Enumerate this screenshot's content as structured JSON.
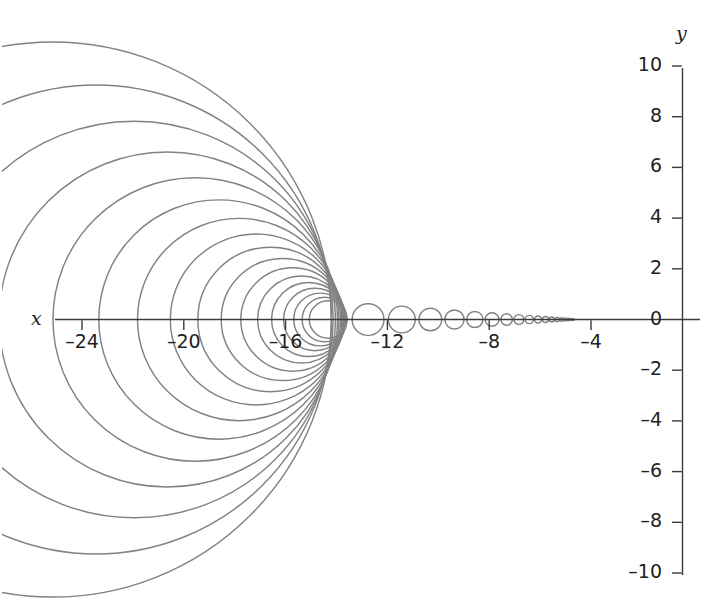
{
  "chart_data": {
    "type": "line",
    "title": "",
    "subtitle": "",
    "xlabel": "x",
    "ylabel": "y",
    "xlim": [
      -25.8,
      -3.0
    ],
    "ylim": [
      -10,
      10
    ],
    "grid": false,
    "legend": null,
    "annotations": [],
    "xticks": [
      -24,
      -20,
      -16,
      -12,
      -8,
      -4
    ],
    "xtick_labels": [
      "–24",
      "–20",
      "–16",
      "–12",
      "–8",
      "–4"
    ],
    "yticks": [
      10,
      8,
      6,
      4,
      2,
      0,
      -2,
      -4,
      -6,
      -8,
      -10
    ],
    "ytick_labels": [
      "10",
      "8",
      "6",
      "4",
      "2",
      "0",
      "–2",
      "–4",
      "–6",
      "–8",
      "–10"
    ],
    "curve_color": "#808285",
    "axis_color": "#3b3b3b",
    "text_color": "#231f20",
    "series": [
      {
        "name": "circle family",
        "shape": "circle",
        "note": "centres on y = 0; radius r_k decreases geometrically; circle k: centre_x = limit - s*r_k, radius = r_k",
        "limit_point_x": -4.2,
        "ratio": 0.845,
        "circles": [
          {
            "cx": -25.15,
            "cy": 0,
            "r": 10.95
          },
          {
            "cx": -23.45,
            "cy": 0,
            "r": 9.25
          },
          {
            "cx": -21.95,
            "cy": 0,
            "r": 7.82
          },
          {
            "cx": -20.65,
            "cy": 0,
            "r": 6.61
          },
          {
            "cx": -19.55,
            "cy": 0,
            "r": 5.59
          },
          {
            "cx": -18.62,
            "cy": 0,
            "r": 4.72
          },
          {
            "cx": -17.83,
            "cy": 0,
            "r": 3.99
          },
          {
            "cx": -17.16,
            "cy": 0,
            "r": 3.37
          },
          {
            "cx": -16.6,
            "cy": 0,
            "r": 2.85
          },
          {
            "cx": -16.12,
            "cy": 0,
            "r": 2.41
          },
          {
            "cx": -15.72,
            "cy": 0,
            "r": 2.04
          },
          {
            "cx": -15.38,
            "cy": 0,
            "r": 1.72
          },
          {
            "cx": -15.09,
            "cy": 0,
            "r": 1.46
          },
          {
            "cx": -14.85,
            "cy": 0,
            "r": 1.23
          },
          {
            "cx": -14.64,
            "cy": 0,
            "r": 1.04
          },
          {
            "cx": -14.47,
            "cy": 0,
            "r": 0.88
          },
          {
            "cx": -14.33,
            "cy": 0,
            "r": 0.74
          }
        ]
      }
    ]
  },
  "axes": {
    "x_axis_label": "x",
    "y_axis_label": "y"
  }
}
